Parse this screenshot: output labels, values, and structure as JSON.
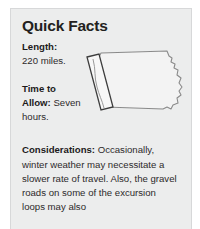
{
  "card": {
    "title": "Quick Facts",
    "background_color": "#eceded",
    "text_color": "#2d2a2b",
    "border_color": "#d7d8d9"
  },
  "facts": [
    {
      "id": "length",
      "label": "Length:",
      "value": "220 miles."
    },
    {
      "id": "time-to-allow",
      "label_line1": "Time to",
      "label_line2": "Allow:",
      "value": "Seven hours."
    }
  ],
  "considerations": {
    "label": "Considerations:",
    "text": "Occasionally, winter weather may necessitate a slower rate of travel. Also, the gravel roads on some of the excursion loops may also"
  },
  "map": {
    "icon_name": "iowa-state-outline",
    "state": "Iowa",
    "fill_color": "#f3f3f3",
    "outline_color": "#8a8a8a",
    "route_highlight": {
      "icon_name": "byway-corridor-strip",
      "position": "western-border",
      "outline_color": "#3d3d3d",
      "fill_color": "#f7f7f7"
    }
  }
}
